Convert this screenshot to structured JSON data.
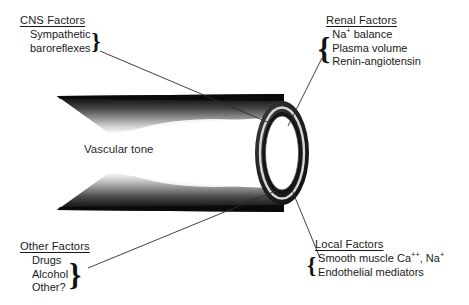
{
  "diagram": {
    "center_label": "Vascular tone",
    "groups": [
      {
        "id": "cns",
        "title": "CNS Factors",
        "brace": "}",
        "brace_side": "right",
        "items": [
          "Sympathetic",
          "baroreflexes"
        ]
      },
      {
        "id": "renal",
        "title": "Renal  Factors",
        "brace": "{",
        "brace_side": "left",
        "items": [
          "Na+ balance",
          "Plasma volume",
          "Renin-angiotensin"
        ]
      },
      {
        "id": "other",
        "title": "Other Factors",
        "brace": "}",
        "brace_side": "right",
        "items": [
          "Drugs",
          "Alcohol",
          "Other?"
        ]
      },
      {
        "id": "local",
        "title": "Local Factors",
        "brace": "{",
        "brace_side": "left",
        "items": [
          "Smooth muscle Ca++, Na+",
          "Endothelial mediators"
        ]
      }
    ],
    "colors": {
      "ink": "#1a1a1a",
      "vessel_wall_dark": "#1b1b1b",
      "vessel_lumen": "#ffffff",
      "leader_line": "#2b2b2b",
      "background": "#ffffff"
    }
  }
}
